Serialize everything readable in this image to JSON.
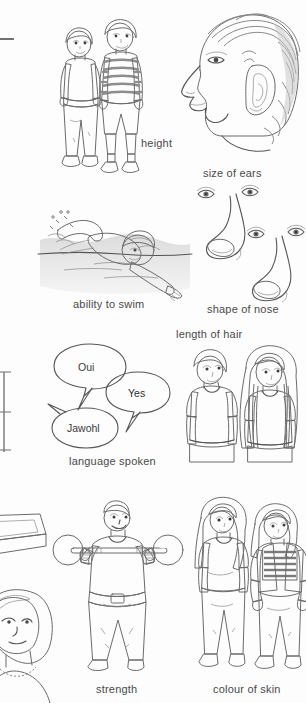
{
  "page": {
    "background_color": "#fdfdfd",
    "ink_color": "#6b6b6b",
    "caption_color": "#4a4a4a"
  },
  "figures": [
    {
      "id": "height",
      "caption": "height",
      "description": "Two boys standing side by side, one taller in striped jumper and shorts, one shorter in dark jumper and trousers"
    },
    {
      "id": "size-of-ears",
      "caption": "size of ears",
      "description": "Profile view of a head with hair showing the ear"
    },
    {
      "id": "ability-to-swim",
      "caption": "ability to swim",
      "description": "A person swimming front crawl in water with a swim cap"
    },
    {
      "id": "shape-of-nose",
      "caption": "shape of nose",
      "description": "Two different nose and eye profiles"
    },
    {
      "id": "length-of-hair",
      "caption": "length of hair",
      "description": "A boy with short hair next to a girl with long hair"
    },
    {
      "id": "language-spoken",
      "caption": "language spoken",
      "description": "Three speech bubbles containing words in different languages"
    },
    {
      "id": "strength",
      "caption": "strength",
      "description": "A person lifting a barbell with round weights"
    },
    {
      "id": "colour-of-skin",
      "caption": "colour of skin",
      "description": "Two girls standing side by side with different skin tones"
    }
  ],
  "speech_bubbles": [
    {
      "text": "Oui",
      "fill": "#eeeeee",
      "id": "bubble-oui"
    },
    {
      "text": "Yes",
      "fill": "#9a9a9a",
      "id": "bubble-yes"
    },
    {
      "text": "Jawohl",
      "fill": "#eeeeee",
      "id": "bubble-jawohl"
    }
  ],
  "edge_fragments": [
    {
      "id": "rule-top-left",
      "description": "Short horizontal rule cropped at the left page edge"
    },
    {
      "id": "table-edge-left",
      "description": "Vertical table border fragment cropped at the left page edge"
    },
    {
      "id": "box-corner-left",
      "description": "Corner of a shaded box illustration cropped at the left page edge"
    },
    {
      "id": "portrait-left",
      "description": "Partial portrait of a girl cropped at the left page edge"
    }
  ]
}
